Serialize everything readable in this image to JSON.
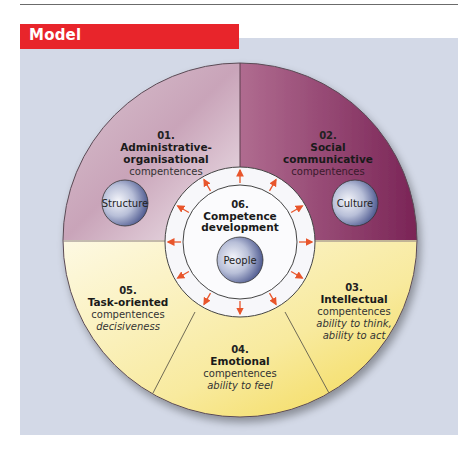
{
  "header": {
    "title": "Model"
  },
  "colors": {
    "header_red": "#e8252b",
    "panel_bg": "#d3d9e7",
    "segment_top_left": "#c7a3b7",
    "segment_top_right": "#8a3563",
    "segment_bottom": "#f6e27a",
    "arrow": "#e8552b",
    "node_blue": "#3c4a86"
  },
  "diagram": {
    "segments": [
      {
        "number": "01.",
        "title_lines": [
          "Administrative-",
          "organisational"
        ],
        "sub": "compentences",
        "italic": []
      },
      {
        "number": "02.",
        "title_lines": [
          "Social",
          "communicative"
        ],
        "sub": "compentences",
        "italic": []
      },
      {
        "number": "03.",
        "title_lines": [
          "Intellectual"
        ],
        "sub": "compentences",
        "italic": [
          "ability to think,",
          "ability to act"
        ]
      },
      {
        "number": "04.",
        "title_lines": [
          "Emotional"
        ],
        "sub": "compentences",
        "italic": [
          "ability to feel"
        ]
      },
      {
        "number": "05.",
        "title_lines": [
          "Task-oriented"
        ],
        "sub": "compentences",
        "italic": [
          "decisiveness"
        ]
      }
    ],
    "center": {
      "number": "06.",
      "title_lines": [
        "Competence",
        "development"
      ]
    },
    "nodes": {
      "structure": "Structure",
      "culture": "Culture",
      "people": "People"
    }
  }
}
